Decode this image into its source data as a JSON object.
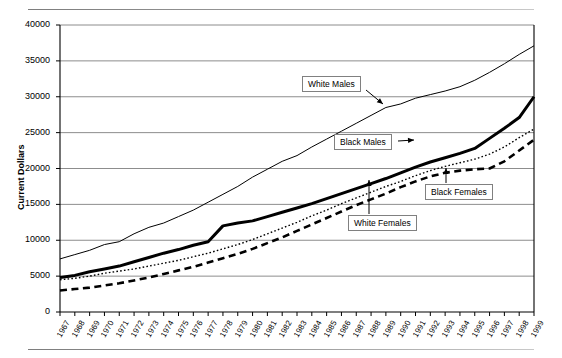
{
  "figure": {
    "ylabel": "Current Dollars",
    "background": "#ffffff",
    "frame_color": "#000000",
    "grid_color": "#808080"
  },
  "annotations": [
    {
      "name": "white-males",
      "label": "White Males"
    },
    {
      "name": "black-males",
      "label": "Black Males"
    },
    {
      "name": "black-females",
      "label": "Black Females"
    },
    {
      "name": "white-females",
      "label": "White Females"
    }
  ],
  "chart_data": {
    "type": "line",
    "title": "",
    "xlabel": "",
    "ylabel": "Current Dollars",
    "ylim": [
      0,
      40000
    ],
    "yticks": [
      0,
      5000,
      10000,
      15000,
      20000,
      25000,
      30000,
      35000,
      40000
    ],
    "ytick_labels": [
      "0",
      "5000",
      "10000",
      "15000",
      "20000",
      "25000",
      "30000",
      "35000",
      "40000"
    ],
    "grid": true,
    "grid_axis": "y",
    "legend": "annotated-callouts",
    "x": [
      1967,
      1968,
      1969,
      1970,
      1971,
      1972,
      1973,
      1974,
      1975,
      1976,
      1977,
      1978,
      1979,
      1980,
      1981,
      1982,
      1983,
      1984,
      1985,
      1986,
      1987,
      1988,
      1989,
      1990,
      1991,
      1992,
      1993,
      1994,
      1995,
      1996,
      1997,
      1998,
      1999
    ],
    "xtick_labels": [
      "1967",
      "1968",
      "1969",
      "1970",
      "1971",
      "1972",
      "1973",
      "1974",
      "1975",
      "1976",
      "1977",
      "1978",
      "1979",
      "1980",
      "1981",
      "1982",
      "1983",
      "1984",
      "1985",
      "1986",
      "1987",
      "1988",
      "1989",
      "1990",
      "1991",
      "1992",
      "1993",
      "1994",
      "1995",
      "1996",
      "1997",
      "1998",
      "1999"
    ],
    "series": [
      {
        "name": "White Males",
        "style": "thin-solid",
        "color": "#000000",
        "linewidth": 1,
        "values": [
          7400,
          8000,
          8600,
          9400,
          9800,
          10900,
          11800,
          12400,
          13300,
          14200,
          15300,
          16400,
          17500,
          18800,
          19900,
          21000,
          21800,
          23000,
          24100,
          25200,
          26300,
          27400,
          28500,
          29000,
          29800,
          30300,
          30800,
          31400,
          32300,
          33400,
          34600,
          35900,
          37100
        ]
      },
      {
        "name": "Black Males",
        "style": "thick-solid",
        "color": "#000000",
        "linewidth": 3,
        "values": [
          4800,
          5100,
          5600,
          6000,
          6400,
          7000,
          7600,
          8200,
          8700,
          9300,
          9800,
          12000,
          12400,
          12700,
          13300,
          13900,
          14500,
          15100,
          15800,
          16500,
          17200,
          17900,
          18600,
          19400,
          20200,
          20900,
          21500,
          22100,
          22800,
          24200,
          25600,
          27100,
          30000
        ]
      },
      {
        "name": "White Females",
        "style": "dotted",
        "color": "#000000",
        "linewidth": 1.4,
        "values": [
          4500,
          4700,
          5000,
          5400,
          5700,
          6000,
          6400,
          6800,
          7200,
          7700,
          8200,
          8800,
          9400,
          10100,
          10900,
          11700,
          12500,
          13400,
          14200,
          15100,
          15900,
          16700,
          17500,
          18200,
          19000,
          19700,
          20300,
          20800,
          21300,
          22000,
          23000,
          24300,
          25500
        ]
      },
      {
        "name": "Black Females",
        "style": "dashed",
        "color": "#000000",
        "linewidth": 2.6,
        "values": [
          3000,
          3200,
          3400,
          3700,
          4000,
          4400,
          4800,
          5300,
          5800,
          6300,
          6900,
          7500,
          8100,
          8800,
          9600,
          10400,
          11300,
          12200,
          13100,
          14000,
          14900,
          15700,
          16500,
          17400,
          18200,
          18900,
          19400,
          19700,
          19900,
          20000,
          21000,
          22500,
          24000
        ]
      }
    ]
  }
}
